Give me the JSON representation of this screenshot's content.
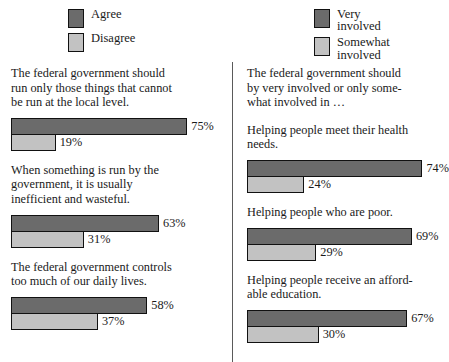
{
  "chart_data": {
    "type": "bar",
    "title": "",
    "orientation": "horizontal",
    "xlabel": "",
    "ylabel": "",
    "xlim": [
      0,
      100
    ],
    "grid": false,
    "legend_position": "top",
    "panels": [
      {
        "id": "attitudes-toward-government",
        "legend": [
          {
            "label": "Agree",
            "color": "#6b6b6b"
          },
          {
            "label": "Disagree",
            "color": "#c2c2c2"
          }
        ],
        "intro": "",
        "series": [
          {
            "name": "Agree",
            "color": "#6b6b6b"
          },
          {
            "name": "Disagree",
            "color": "#c2c2c2"
          }
        ],
        "groups": [
          {
            "label": "The federal government  should\nrun only those things that cannot\nbe run at the local level.",
            "bars": [
              {
                "series": "Agree",
                "value": 75,
                "value_label": "75%"
              },
              {
                "series": "Disagree",
                "value": 19,
                "value_label": "19%"
              }
            ]
          },
          {
            "label": "When something is run by the\ngovernment, it is usually\ninefficient and wasteful.",
            "bars": [
              {
                "series": "Agree",
                "value": 63,
                "value_label": "63%"
              },
              {
                "series": "Disagree",
                "value": 31,
                "value_label": "31%"
              }
            ]
          },
          {
            "label": "The federal government controls\ntoo much of our daily lives.",
            "bars": [
              {
                "series": "Agree",
                "value": 58,
                "value_label": "58%"
              },
              {
                "series": "Disagree",
                "value": 37,
                "value_label": "37%"
              }
            ]
          }
        ]
      },
      {
        "id": "government-involvement",
        "legend": [
          {
            "label": "Very\ninvolved",
            "color": "#6b6b6b"
          },
          {
            "label": "Somewhat\ninvolved",
            "color": "#c2c2c2"
          }
        ],
        "intro": "The federal government should\nby very involved or only some-\nwhat involved in …",
        "series": [
          {
            "name": "Very involved",
            "color": "#6b6b6b"
          },
          {
            "name": "Somewhat involved",
            "color": "#c2c2c2"
          }
        ],
        "groups": [
          {
            "label": "Helping people meet their health\nneeds.",
            "bars": [
              {
                "series": "Very involved",
                "value": 74,
                "value_label": "74%"
              },
              {
                "series": "Somewhat involved",
                "value": 24,
                "value_label": "24%"
              }
            ]
          },
          {
            "label": "Helping people who are poor.",
            "bars": [
              {
                "series": "Very involved",
                "value": 69,
                "value_label": "69%"
              },
              {
                "series": "Somewhat involved",
                "value": 29,
                "value_label": "29%"
              }
            ]
          },
          {
            "label": "Helping people receive an afford-\nable education.",
            "bars": [
              {
                "series": "Very involved",
                "value": 67,
                "value_label": "67%"
              },
              {
                "series": "Somewhat involved",
                "value": 30,
                "value_label": "30%"
              }
            ]
          }
        ]
      }
    ]
  },
  "style": {
    "dark_color": "#6b6b6b",
    "light_color": "#c2c2c2",
    "border_color": "#111111",
    "background": "#ffffff",
    "divider_color": "#5a5a5a",
    "px_per_percent_left": 2.35,
    "px_per_percent_right": 2.39
  }
}
